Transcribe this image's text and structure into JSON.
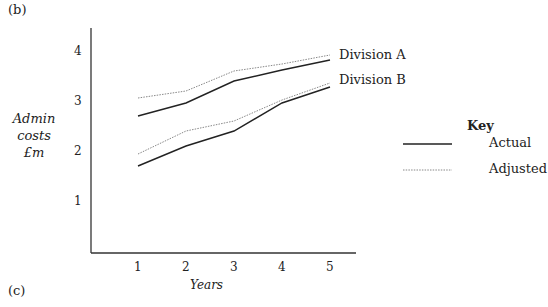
{
  "panel_labels": {
    "top": "(b)",
    "bottom": "(c)"
  },
  "axes": {
    "ylabel_lines": [
      "Admin",
      "costs",
      "£m"
    ],
    "xlabel": "Years",
    "yticks": [
      "1",
      "2",
      "3",
      "4"
    ],
    "xticks": [
      "1",
      "2",
      "3",
      "4",
      "5"
    ]
  },
  "series_labels": {
    "a": "Division A",
    "b": "Division B"
  },
  "key": {
    "title": "Key",
    "actual": "Actual",
    "adjusted": "Adjusted"
  },
  "chart_data": {
    "type": "line",
    "title": "",
    "xlabel": "Years",
    "ylabel": "Admin costs £m",
    "x": [
      1,
      2,
      3,
      4,
      5
    ],
    "xlim": [
      0,
      5
    ],
    "ylim": [
      0,
      4.4
    ],
    "grid": false,
    "legend_position": "right",
    "legend_title": "Key",
    "series": [
      {
        "name": "Division A – Actual",
        "style": "solid",
        "values": [
          2.74,
          3.0,
          3.44,
          3.66,
          3.86
        ]
      },
      {
        "name": "Division A – Adjusted",
        "style": "dotted",
        "values": [
          3.1,
          3.24,
          3.64,
          3.78,
          3.96
        ]
      },
      {
        "name": "Division B – Actual",
        "style": "solid",
        "values": [
          1.74,
          2.14,
          2.44,
          3.0,
          3.32
        ]
      },
      {
        "name": "Division B – Adjusted",
        "style": "dotted",
        "values": [
          1.98,
          2.44,
          2.64,
          3.06,
          3.4
        ]
      }
    ],
    "annotations": [
      "Division A",
      "Division B"
    ]
  }
}
